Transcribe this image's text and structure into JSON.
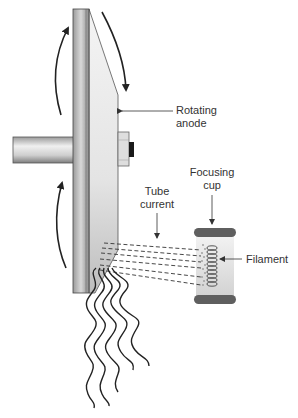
{
  "diagram": {
    "labels": {
      "rotating_anode_line1": "Rotating",
      "rotating_anode_line2": "anode",
      "tube_current_line1": "Tube",
      "tube_current_line2": "current",
      "focusing_cup_line1": "Focusing",
      "focusing_cup_line2": "cup",
      "filament": "Filament"
    },
    "colors": {
      "outline": "#222222",
      "disc_dark": "#7a7a7a",
      "disc_light": "#e6e6e6",
      "cup_dark": "#5f5f5f",
      "text": "#333333"
    }
  }
}
